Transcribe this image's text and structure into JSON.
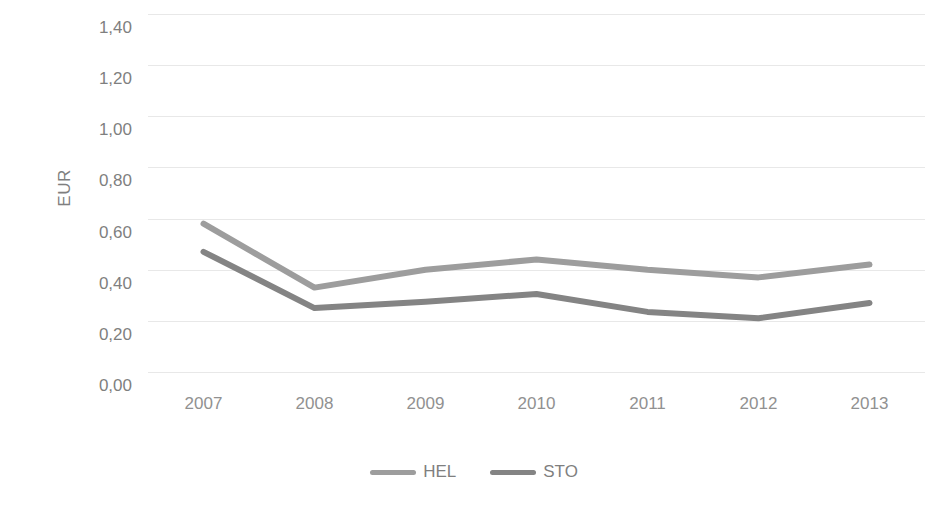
{
  "chart_data": {
    "type": "line",
    "title": "",
    "subtitle": "",
    "xlabel": "",
    "ylabel": "EUR",
    "categories": [
      "2007",
      "2008",
      "2009",
      "2010",
      "2011",
      "2012",
      "2013"
    ],
    "series": [
      {
        "name": "HEL",
        "color": "#9d9d9d",
        "values": [
          0.58,
          0.33,
          0.4,
          0.44,
          0.4,
          0.37,
          0.42
        ]
      },
      {
        "name": "STO",
        "color": "#848484",
        "values": [
          0.47,
          0.25,
          0.275,
          0.305,
          0.235,
          0.21,
          0.27
        ]
      }
    ],
    "ylim": [
      0.0,
      1.4
    ],
    "ytick_step": 0.2,
    "ytick_labels": [
      "0,00",
      "0,20",
      "0,40",
      "0,60",
      "0,80",
      "1,00",
      "1,20",
      "1,40"
    ],
    "ytick_values": [
      0.0,
      0.2,
      0.4,
      0.6,
      0.8,
      1.0,
      1.2,
      1.4
    ],
    "grid": "horizontal",
    "gridline_color": "#e8e8e8",
    "legend_position": "bottom",
    "decimal_separator": ","
  },
  "legend": {
    "entries": [
      {
        "label": "HEL"
      },
      {
        "label": "STO"
      }
    ]
  }
}
